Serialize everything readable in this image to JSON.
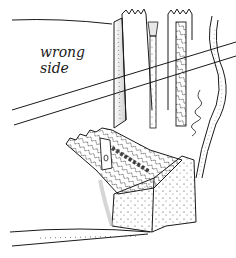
{
  "diagram": {
    "labels": {
      "wrong_side_line1": "wrong",
      "wrong_side_line2": "side"
    },
    "colors": {
      "ink": "#1a1a1a",
      "background": "#ffffff",
      "shade": "#cfcfcf"
    }
  }
}
